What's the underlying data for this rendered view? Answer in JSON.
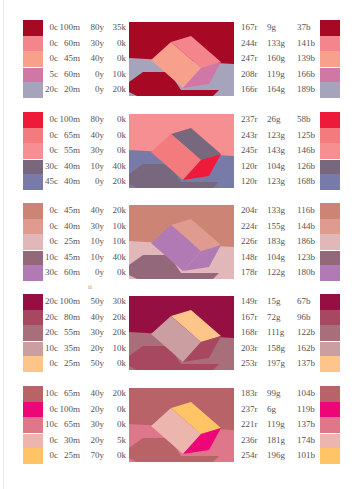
{
  "page": {
    "folio": "ii"
  },
  "sections": [
    {
      "rows": [
        {
          "c": "0c",
          "m": "100m",
          "y": "80y",
          "k": "35k",
          "r": "167r",
          "g": "9g",
          "b": "37b",
          "hex": "#a70925"
        },
        {
          "c": "0c",
          "m": "60m",
          "y": "30y",
          "k": "0k",
          "r": "244r",
          "g": "133g",
          "b": "141b",
          "hex": "#f4858d"
        },
        {
          "c": "0c",
          "m": "45m",
          "y": "40y",
          "k": "0k",
          "r": "247r",
          "g": "160g",
          "b": "139b",
          "hex": "#f7a08b"
        },
        {
          "c": "5c",
          "m": "60m",
          "y": "0y",
          "k": "10k",
          "r": "208r",
          "g": "119g",
          "b": "166b",
          "hex": "#d077a6"
        },
        {
          "c": "20c",
          "m": "20m",
          "y": "0y",
          "k": "20k",
          "r": "166r",
          "g": "164g",
          "b": "189b",
          "hex": "#a6a4bd"
        }
      ],
      "scene": {
        "bg": "#a70925",
        "floor": "#a6a4bd",
        "top": "#f4858d",
        "front": "#f7a08b",
        "side": "#d077a6",
        "shadow": "#a70925",
        "variant": "a"
      }
    },
    {
      "rows": [
        {
          "c": "0c",
          "m": "100m",
          "y": "80y",
          "k": "0k",
          "r": "237r",
          "g": "26g",
          "b": "58b",
          "hex": "#ed1a3a"
        },
        {
          "c": "0c",
          "m": "65m",
          "y": "40y",
          "k": "0k",
          "r": "243r",
          "g": "123g",
          "b": "125b",
          "hex": "#f37b7d"
        },
        {
          "c": "0c",
          "m": "55m",
          "y": "30y",
          "k": "0k",
          "r": "245r",
          "g": "143g",
          "b": "146b",
          "hex": "#f58f92"
        },
        {
          "c": "30c",
          "m": "40m",
          "y": "10y",
          "k": "40k",
          "r": "120r",
          "g": "104g",
          "b": "126b",
          "hex": "#78687e"
        },
        {
          "c": "45c",
          "m": "40m",
          "y": "0y",
          "k": "20k",
          "r": "120r",
          "g": "123g",
          "b": "168b",
          "hex": "#787ba8"
        }
      ],
      "scene": {
        "bg": "#f58f92",
        "floor": "#787ba8",
        "top": "#78687e",
        "front": "#f37b7d",
        "side": "#ed1a3a",
        "shadow": "#78687e",
        "variant": "b"
      }
    },
    {
      "rows": [
        {
          "c": "0c",
          "m": "45m",
          "y": "40y",
          "k": "20k",
          "r": "204r",
          "g": "133g",
          "b": "116b",
          "hex": "#cc8574"
        },
        {
          "c": "0c",
          "m": "40m",
          "y": "30y",
          "k": "10k",
          "r": "224r",
          "g": "155g",
          "b": "144b",
          "hex": "#e09b90"
        },
        {
          "c": "0c",
          "m": "25m",
          "y": "10y",
          "k": "10k",
          "r": "226r",
          "g": "183g",
          "b": "186b",
          "hex": "#e2b7ba"
        },
        {
          "c": "10c",
          "m": "45m",
          "y": "10y",
          "k": "40k",
          "r": "148r",
          "g": "104g",
          "b": "123b",
          "hex": "#94687b"
        },
        {
          "c": "30c",
          "m": "60m",
          "y": "0y",
          "k": "0k",
          "r": "178r",
          "g": "122g",
          "b": "180b",
          "hex": "#b27ab4"
        }
      ],
      "scene": {
        "bg": "#cc8574",
        "floor": "#e2b7ba",
        "top": "#e09b90",
        "front": "#b27ab4",
        "side": "#b27ab4",
        "shadow": "#94687b",
        "variant": "c"
      }
    },
    {
      "rows": [
        {
          "c": "20c",
          "m": "100m",
          "y": "50y",
          "k": "30k",
          "r": "149r",
          "g": "15g",
          "b": "67b",
          "hex": "#950f43"
        },
        {
          "c": "20c",
          "m": "80m",
          "y": "40y",
          "k": "20k",
          "r": "167r",
          "g": "72g",
          "b": "96b",
          "hex": "#a74860"
        },
        {
          "c": "20c",
          "m": "55m",
          "y": "30y",
          "k": "20k",
          "r": "168r",
          "g": "111g",
          "b": "122b",
          "hex": "#a86f7a"
        },
        {
          "c": "10c",
          "m": "35m",
          "y": "20y",
          "k": "10k",
          "r": "203r",
          "g": "158g",
          "b": "162b",
          "hex": "#cb9ea2"
        },
        {
          "c": "0c",
          "m": "25m",
          "y": "50y",
          "k": "0k",
          "r": "253r",
          "g": "197g",
          "b": "137b",
          "hex": "#fdc589"
        }
      ],
      "scene": {
        "bg": "#950f43",
        "floor": "#a86f7a",
        "top": "#fdc589",
        "front": "#cb9ea2",
        "side": "#a74860",
        "shadow": "#a74860",
        "variant": "d"
      }
    },
    {
      "rows": [
        {
          "c": "10c",
          "m": "65m",
          "y": "40y",
          "k": "20k",
          "r": "183r",
          "g": "99g",
          "b": "104b",
          "hex": "#b76368"
        },
        {
          "c": "0c",
          "m": "100m",
          "y": "20y",
          "k": "0k",
          "r": "237r",
          "g": "6g",
          "b": "119b",
          "hex": "#ed0677"
        },
        {
          "c": "10c",
          "m": "65m",
          "y": "30y",
          "k": "0k",
          "r": "221r",
          "g": "119g",
          "b": "137b",
          "hex": "#dd7789"
        },
        {
          "c": "0c",
          "m": "30m",
          "y": "20y",
          "k": "5k",
          "r": "236r",
          "g": "181g",
          "b": "174b",
          "hex": "#ecb5ae"
        },
        {
          "c": "0c",
          "m": "25m",
          "y": "70y",
          "k": "0k",
          "r": "254r",
          "g": "196g",
          "b": "101b",
          "hex": "#fec465"
        }
      ],
      "scene": {
        "bg": "#b76368",
        "floor": "#dd7789",
        "top": "#fec465",
        "front": "#ecb5ae",
        "side": "#ed0677",
        "shadow": "#b76368",
        "variant": "e"
      }
    }
  ]
}
